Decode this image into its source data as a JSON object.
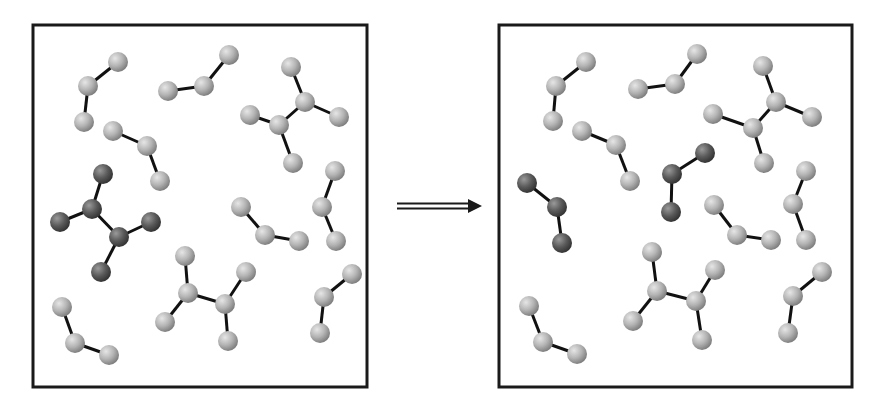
{
  "diagram": {
    "type": "molecular-reaction-schematic",
    "colors": {
      "background": "#ffffff",
      "frame": "#1a1a1a",
      "bond": "#111111",
      "light_atom": "#b4b4b4",
      "dark_atom": "#5a5a5a",
      "arrow": "#1a1a1a"
    },
    "atom_radius": 10,
    "panels": [
      {
        "id": "before",
        "frame": {
          "x": 33,
          "y": 25,
          "w": 334,
          "h": 362
        },
        "molecules": [
          {
            "shade": "light",
            "atoms": [
              [
                118,
                62
              ],
              [
                88,
                86
              ],
              [
                84,
                122
              ]
            ],
            "bonds": [
              [
                0,
                1
              ],
              [
                1,
                2
              ]
            ]
          },
          {
            "shade": "light",
            "atoms": [
              [
                168,
                91
              ],
              [
                204,
                86
              ],
              [
                229,
                55
              ]
            ],
            "bonds": [
              [
                0,
                1
              ],
              [
                1,
                2
              ]
            ]
          },
          {
            "shade": "light",
            "atoms": [
              [
                291,
                67
              ],
              [
                305,
                102
              ],
              [
                339,
                117
              ],
              [
                279,
                125
              ],
              [
                250,
                115
              ],
              [
                293,
                163
              ]
            ],
            "bonds": [
              [
                0,
                1
              ],
              [
                1,
                2
              ],
              [
                1,
                3
              ],
              [
                3,
                4
              ],
              [
                3,
                5
              ]
            ]
          },
          {
            "shade": "light",
            "atoms": [
              [
                113,
                131
              ],
              [
                147,
                146
              ],
              [
                160,
                181
              ]
            ],
            "bonds": [
              [
                0,
                1
              ],
              [
                1,
                2
              ]
            ]
          },
          {
            "shade": "dark",
            "atoms": [
              [
                103,
                174
              ],
              [
                92,
                209
              ],
              [
                60,
                222
              ],
              [
                119,
                237
              ],
              [
                151,
                222
              ],
              [
                101,
                272
              ]
            ],
            "bonds": [
              [
                0,
                1
              ],
              [
                1,
                2
              ],
              [
                1,
                3
              ],
              [
                3,
                4
              ],
              [
                3,
                5
              ]
            ]
          },
          {
            "shade": "light",
            "atoms": [
              [
                241,
                207
              ],
              [
                265,
                235
              ],
              [
                299,
                241
              ]
            ],
            "bonds": [
              [
                0,
                1
              ],
              [
                1,
                2
              ]
            ]
          },
          {
            "shade": "light",
            "atoms": [
              [
                335,
                171
              ],
              [
                322,
                207
              ],
              [
                336,
                241
              ]
            ],
            "bonds": [
              [
                0,
                1
              ],
              [
                1,
                2
              ]
            ]
          },
          {
            "shade": "light",
            "atoms": [
              [
                185,
                256
              ],
              [
                188,
                293
              ],
              [
                165,
                322
              ],
              [
                225,
                304
              ],
              [
                246,
                272
              ],
              [
                228,
                341
              ]
            ],
            "bonds": [
              [
                0,
                1
              ],
              [
                1,
                2
              ],
              [
                1,
                3
              ],
              [
                3,
                4
              ],
              [
                3,
                5
              ]
            ]
          },
          {
            "shade": "light",
            "atoms": [
              [
                352,
                274
              ],
              [
                324,
                297
              ],
              [
                320,
                333
              ]
            ],
            "bonds": [
              [
                0,
                1
              ],
              [
                1,
                2
              ]
            ]
          },
          {
            "shade": "light",
            "atoms": [
              [
                62,
                307
              ],
              [
                75,
                343
              ],
              [
                109,
                355
              ]
            ],
            "bonds": [
              [
                0,
                1
              ],
              [
                1,
                2
              ]
            ]
          }
        ]
      },
      {
        "id": "after",
        "frame": {
          "x": 499,
          "y": 25,
          "w": 353,
          "h": 362
        },
        "molecules": [
          {
            "shade": "light",
            "atoms": [
              [
                586,
                62
              ],
              [
                556,
                86
              ],
              [
                553,
                121
              ]
            ],
            "bonds": [
              [
                0,
                1
              ],
              [
                1,
                2
              ]
            ]
          },
          {
            "shade": "light",
            "atoms": [
              [
                638,
                89
              ],
              [
                675,
                84
              ],
              [
                697,
                54
              ]
            ],
            "bonds": [
              [
                0,
                1
              ],
              [
                1,
                2
              ]
            ]
          },
          {
            "shade": "light",
            "atoms": [
              [
                763,
                66
              ],
              [
                776,
                102
              ],
              [
                812,
                117
              ],
              [
                753,
                128
              ],
              [
                713,
                114
              ],
              [
                764,
                163
              ]
            ],
            "bonds": [
              [
                0,
                1
              ],
              [
                1,
                2
              ],
              [
                1,
                3
              ],
              [
                3,
                4
              ],
              [
                3,
                5
              ]
            ]
          },
          {
            "shade": "light",
            "atoms": [
              [
                582,
                131
              ],
              [
                616,
                145
              ],
              [
                630,
                181
              ]
            ],
            "bonds": [
              [
                0,
                1
              ],
              [
                1,
                2
              ]
            ]
          },
          {
            "shade": "dark",
            "atoms": [
              [
                527,
                183
              ],
              [
                557,
                207
              ],
              [
                562,
                243
              ]
            ],
            "bonds": [
              [
                0,
                1
              ],
              [
                1,
                2
              ]
            ]
          },
          {
            "shade": "dark",
            "atoms": [
              [
                705,
                153
              ],
              [
                672,
                174
              ],
              [
                671,
                212
              ]
            ],
            "bonds": [
              [
                0,
                1
              ],
              [
                1,
                2
              ]
            ]
          },
          {
            "shade": "light",
            "atoms": [
              [
                714,
                205
              ],
              [
                737,
                235
              ],
              [
                771,
                240
              ]
            ],
            "bonds": [
              [
                0,
                1
              ],
              [
                1,
                2
              ]
            ]
          },
          {
            "shade": "light",
            "atoms": [
              [
                806,
                171
              ],
              [
                793,
                204
              ],
              [
                806,
                240
              ]
            ],
            "bonds": [
              [
                0,
                1
              ],
              [
                1,
                2
              ]
            ]
          },
          {
            "shade": "light",
            "atoms": [
              [
                652,
                252
              ],
              [
                657,
                291
              ],
              [
                633,
                321
              ],
              [
                696,
                301
              ],
              [
                715,
                270
              ],
              [
                702,
                340
              ]
            ],
            "bonds": [
              [
                0,
                1
              ],
              [
                1,
                2
              ],
              [
                1,
                3
              ],
              [
                3,
                4
              ],
              [
                3,
                5
              ]
            ]
          },
          {
            "shade": "light",
            "atoms": [
              [
                822,
                272
              ],
              [
                793,
                296
              ],
              [
                788,
                333
              ]
            ],
            "bonds": [
              [
                0,
                1
              ],
              [
                1,
                2
              ]
            ]
          },
          {
            "shade": "light",
            "atoms": [
              [
                529,
                306
              ],
              [
                543,
                342
              ],
              [
                577,
                354
              ]
            ],
            "bonds": [
              [
                0,
                1
              ],
              [
                1,
                2
              ]
            ]
          }
        ]
      }
    ],
    "arrow": {
      "x1": 397,
      "x2": 482,
      "y": 206,
      "style": "double-line-right"
    }
  }
}
